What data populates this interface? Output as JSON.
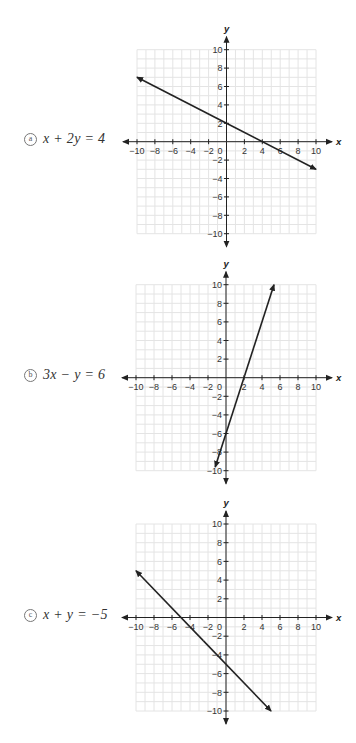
{
  "chart_data": [
    {
      "id": "a",
      "type": "line",
      "badge": "a",
      "equation": "x + 2y = 4",
      "title": "",
      "xlabel": "x",
      "ylabel": "y",
      "xlim": [
        -10,
        10
      ],
      "ylim": [
        -10,
        10
      ],
      "grid": true,
      "xticks": [
        -10,
        -8,
        -6,
        -4,
        -2,
        2,
        4,
        6,
        8,
        10
      ],
      "yticks": [
        -10,
        -8,
        -6,
        -4,
        -2,
        2,
        4,
        6,
        8,
        10
      ],
      "origin_label": "0",
      "series": [
        {
          "name": "x + 2y = 4",
          "x": [
            -10,
            10
          ],
          "y": [
            7,
            -3
          ],
          "arrows": "both"
        }
      ],
      "layout": {
        "ox": 226.5,
        "oy": 141.7,
        "sx": 8.95,
        "sy": 9.2,
        "label_y": 131
      }
    },
    {
      "id": "b",
      "type": "line",
      "badge": "b",
      "equation": "3x − y = 6",
      "title": "",
      "xlabel": "x",
      "ylabel": "y",
      "xlim": [
        -10,
        10
      ],
      "ylim": [
        -10,
        10
      ],
      "grid": true,
      "xticks": [
        -10,
        -8,
        -6,
        -4,
        -2,
        2,
        4,
        6,
        8,
        10
      ],
      "yticks": [
        -10,
        -8,
        -6,
        -4,
        -2,
        2,
        4,
        6,
        8,
        10
      ],
      "origin_label": "0",
      "series": [
        {
          "name": "3x − y = 6",
          "x": [
            -1.2,
            5.33
          ],
          "y": [
            -9.6,
            10
          ],
          "arrows": "both"
        }
      ],
      "layout": {
        "ox": 226,
        "oy": 377.7,
        "sx": 9.0,
        "sy": 9.3,
        "label_y": 367
      }
    },
    {
      "id": "c",
      "type": "line",
      "badge": "c",
      "equation": "x + y = −5",
      "title": "",
      "xlabel": "x",
      "ylabel": "y",
      "xlim": [
        -10,
        10
      ],
      "ylim": [
        -10,
        10
      ],
      "grid": true,
      "xticks": [
        -10,
        -8,
        -6,
        -4,
        -2,
        2,
        4,
        6,
        8,
        10
      ],
      "yticks": [
        -10,
        -8,
        -6,
        -4,
        -2,
        2,
        4,
        6,
        8,
        10
      ],
      "origin_label": "0",
      "series": [
        {
          "name": "x + y = −5",
          "x": [
            -10,
            5
          ],
          "y": [
            5,
            -10
          ],
          "arrows": "both"
        }
      ],
      "layout": {
        "ox": 226,
        "oy": 617.5,
        "sx": 9.0,
        "sy": 9.35,
        "label_y": 607
      }
    }
  ]
}
